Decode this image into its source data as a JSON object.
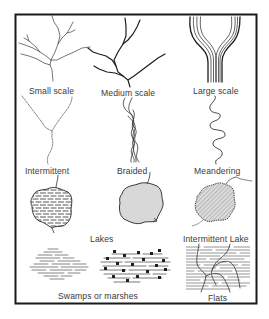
{
  "figure": {
    "colors": {
      "ink": "#1e1e1e",
      "label": "#3a3a3a",
      "fill_gray": "#d4d4d4",
      "hatch": "#6a6a6a"
    }
  },
  "drainage": {
    "small_scale": "Small scale",
    "medium_scale": "Medium scale",
    "large_scale": "Large scale"
  },
  "streams": {
    "intermittent": "Intermittent",
    "braided": "Braided",
    "meandering": "Meandering"
  },
  "lakes": {
    "label": "Lakes",
    "intermittent_lake": "Intermittent Lake"
  },
  "wetlands": {
    "swamps": "Swamps or marshes",
    "flats": "Flats"
  }
}
